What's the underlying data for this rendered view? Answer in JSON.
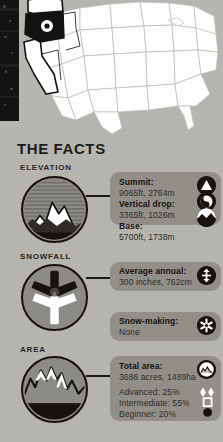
{
  "panel": {
    "map_alt": "united-states-map-with-oregon-highlighted",
    "highlight_state": "Oregon",
    "marker": "resort-location-marker"
  },
  "facts": {
    "title": "THE FACTS",
    "sections": [
      {
        "id": "elevation",
        "label": "ELEVATION",
        "icon": "mountain-peak-icon",
        "rows": [
          {
            "title": "Summit:",
            "value": "9065ft, 2764m",
            "badge": "summit-peak-icon"
          },
          {
            "title": "Vertical drop:",
            "value": "3365ft, 1026m",
            "badge": "vertical-drop-icon"
          },
          {
            "title": "Base:",
            "value": "5700ft, 1738m",
            "badge": "base-elevation-icon"
          }
        ]
      },
      {
        "id": "snowfall",
        "label": "SNOWFALL",
        "icon": "snowflake-icon",
        "rows": [
          {
            "title": "Average annual:",
            "value": "300 inches, 762cm",
            "badge": "snow-depth-icon"
          },
          {
            "title": "Snow-making:",
            "value": "None",
            "badge": "snow-making-icon"
          }
        ]
      },
      {
        "id": "area",
        "label": "AREA",
        "icon": "mountain-range-icon",
        "rows": [
          {
            "title": "Total area:",
            "value": "3686 acres, 1489ha",
            "badge": "terrain-area-icon"
          }
        ],
        "difficulty": [
          {
            "label": "Advanced: 25%",
            "glyph": "double-black-diamond-icon"
          },
          {
            "label": "Intermediate: 55%",
            "glyph": "blue-square-icon"
          },
          {
            "label": "Beginner: 20%",
            "glyph": "green-circle-icon"
          }
        ]
      }
    ]
  },
  "colors": {
    "background": "#b8b6b1",
    "pill": "#939089",
    "disc": "#8e8c88",
    "ink": "#17130f",
    "map_fill": "#ffffff",
    "map_stroke": "#b9b7b3",
    "highlight": "#111111"
  }
}
